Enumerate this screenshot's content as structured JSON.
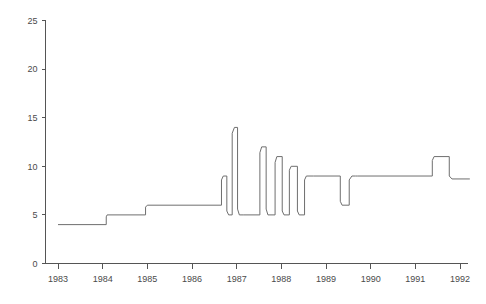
{
  "chart_data": {
    "type": "line",
    "title": "",
    "subtitle": "",
    "xlabel": "",
    "ylabel": "",
    "xlim": [
      1982.8,
      1992.35
    ],
    "ylim": [
      0,
      25
    ],
    "grid": false,
    "legend": false,
    "line_style": "step",
    "line_color": "#6e6e6e",
    "axis_color": "#555555",
    "x_ticks": [
      1983,
      1984,
      1985,
      1986,
      1987,
      1988,
      1989,
      1990,
      1991,
      1992
    ],
    "x_tick_labels": [
      "1983",
      "1984",
      "1985",
      "1986",
      "1987",
      "1988",
      "1989",
      "1990",
      "1991",
      "1992"
    ],
    "y_ticks": [
      0,
      5,
      10,
      15,
      20,
      25
    ],
    "y_tick_labels": [
      "0",
      "5",
      "10",
      "15",
      "20",
      "25"
    ],
    "series": [
      {
        "name": "series-1",
        "x": [
          1983.0,
          1984.08,
          1984.08,
          1984.1,
          1984.96,
          1984.96,
          1985.0,
          1986.66,
          1986.66,
          1986.7,
          1986.78,
          1986.78,
          1986.82,
          1986.9,
          1986.9,
          1986.95,
          1987.02,
          1987.02,
          1987.06,
          1987.16,
          1987.16,
          1987.52,
          1987.52,
          1987.56,
          1987.66,
          1987.66,
          1987.7,
          1987.86,
          1987.86,
          1987.9,
          1988.02,
          1988.02,
          1988.06,
          1988.18,
          1988.18,
          1988.22,
          1988.36,
          1988.36,
          1988.4,
          1988.52,
          1988.52,
          1988.56,
          1988.72,
          1988.72,
          1989.32,
          1989.32,
          1989.36,
          1989.52,
          1989.52,
          1989.58,
          1989.66,
          1989.66,
          1989.7,
          1991.38,
          1991.38,
          1991.42,
          1991.76,
          1991.76,
          1991.82,
          1992.22
        ],
        "y": [
          4.0,
          4.0,
          4.8,
          5.0,
          5.0,
          5.8,
          6.0,
          6.0,
          8.6,
          9.0,
          9.0,
          5.4,
          5.0,
          5.0,
          13.4,
          14.0,
          14.0,
          5.6,
          5.0,
          5.0,
          5.0,
          5.0,
          11.4,
          12.0,
          12.0,
          5.6,
          5.0,
          5.0,
          10.4,
          11.0,
          11.0,
          5.4,
          5.0,
          5.0,
          9.6,
          10.0,
          10.0,
          5.4,
          5.0,
          5.0,
          8.6,
          9.0,
          9.0,
          9.0,
          9.0,
          6.4,
          6.0,
          6.0,
          8.6,
          9.0,
          9.0,
          9.0,
          9.0,
          9.0,
          10.6,
          11.0,
          11.0,
          9.0,
          8.7,
          8.7
        ],
        "value_range": [
          4,
          14
        ],
        "start_value": 4,
        "end_value": 8.7,
        "peak_value": 14,
        "peak_x": 1986.95
      }
    ],
    "annotations": []
  },
  "axes": {
    "y_axis_name": "y-axis",
    "x_axis_name": "x-axis"
  }
}
